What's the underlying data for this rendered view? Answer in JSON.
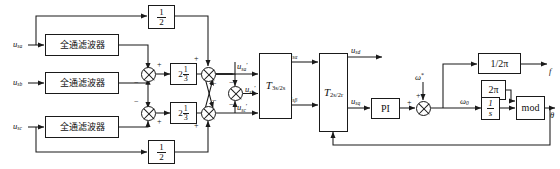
{
  "diagram": {
    "inputs": [
      {
        "id": "usa",
        "label_base": "u",
        "label_sub": "sa"
      },
      {
        "id": "usb",
        "label_base": "u",
        "label_sub": "sb"
      },
      {
        "id": "usc",
        "label_base": "u",
        "label_sub": "sc"
      }
    ],
    "filters": [
      {
        "id": "apf-a",
        "label": "全通滤波器"
      },
      {
        "id": "apf-b",
        "label": "全通滤波器"
      },
      {
        "id": "apf-c",
        "label": "全通滤波器"
      }
    ],
    "gain_blocks": [
      {
        "id": "half-top",
        "numerator": "1",
        "denominator": "2",
        "text": "1/2"
      },
      {
        "id": "half-bottom",
        "numerator": "1",
        "denominator": "2",
        "text": "1/2"
      },
      {
        "id": "twothird-top",
        "whole": "2",
        "numerator": "1",
        "denominator": "3",
        "text": "2/3"
      },
      {
        "id": "twothird-bottom",
        "whole": "2",
        "numerator": "1",
        "denominator": "3",
        "text": "2/3"
      }
    ],
    "transform_blocks": [
      {
        "id": "t3s2s",
        "symbol": "T",
        "subscript": "3s/2s"
      },
      {
        "id": "t2s2r",
        "symbol": "T",
        "subscript": "2s/2r"
      }
    ],
    "controller": {
      "id": "pi",
      "label": "PI"
    },
    "right_blocks": [
      {
        "id": "one-over-2pi",
        "label": "1/2π"
      },
      {
        "id": "two-pi",
        "label": "2π"
      },
      {
        "id": "integrator",
        "numerator": "1",
        "denominator": "s",
        "text": "1/s"
      },
      {
        "id": "mod",
        "label": "mod"
      }
    ],
    "intermediate_signals": [
      {
        "id": "usa-prime",
        "base": "u",
        "sub": "sa",
        "prime": "′"
      },
      {
        "id": "usb-prime",
        "base": "u",
        "sub": "sb",
        "prime": "′"
      },
      {
        "id": "usc-prime",
        "base": "u",
        "sub": "sc",
        "prime": "′"
      },
      {
        "id": "us-alpha",
        "base": "u",
        "sub": "sα"
      },
      {
        "id": "us-beta",
        "base": "u",
        "sub": "sβ"
      },
      {
        "id": "us-d",
        "base": "u",
        "sub": "sd"
      },
      {
        "id": "us-q",
        "base": "u",
        "sub": "sq"
      }
    ],
    "omega_ref": {
      "base": "ω",
      "sup": "*"
    },
    "omega_zero": {
      "base": "ω",
      "sub": "0"
    },
    "outputs": [
      {
        "id": "freq",
        "label": "f"
      },
      {
        "id": "theta",
        "label": "θ"
      }
    ],
    "signs": {
      "plus": "+",
      "minus": "−"
    },
    "colors": {
      "line": "#1a1a1a",
      "background": "#ffffff",
      "text": "#111111"
    }
  }
}
